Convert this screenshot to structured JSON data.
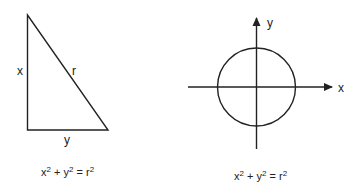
{
  "triangle": {
    "labels": {
      "vertical_side": "x",
      "hypotenuse": "r",
      "horizontal_side": "y"
    },
    "equation": {
      "a": "x",
      "b": "y",
      "c": "r",
      "exp": "2",
      "plus": " + ",
      "equals": " = "
    }
  },
  "circle_plot": {
    "axis_labels": {
      "x": "x",
      "y": "y"
    },
    "equation": {
      "a": "x",
      "b": "y",
      "c": "r",
      "exp": "2",
      "plus": " + ",
      "equals": " = "
    }
  },
  "colors": {
    "stroke": "#222222",
    "background": "#ffffff"
  }
}
